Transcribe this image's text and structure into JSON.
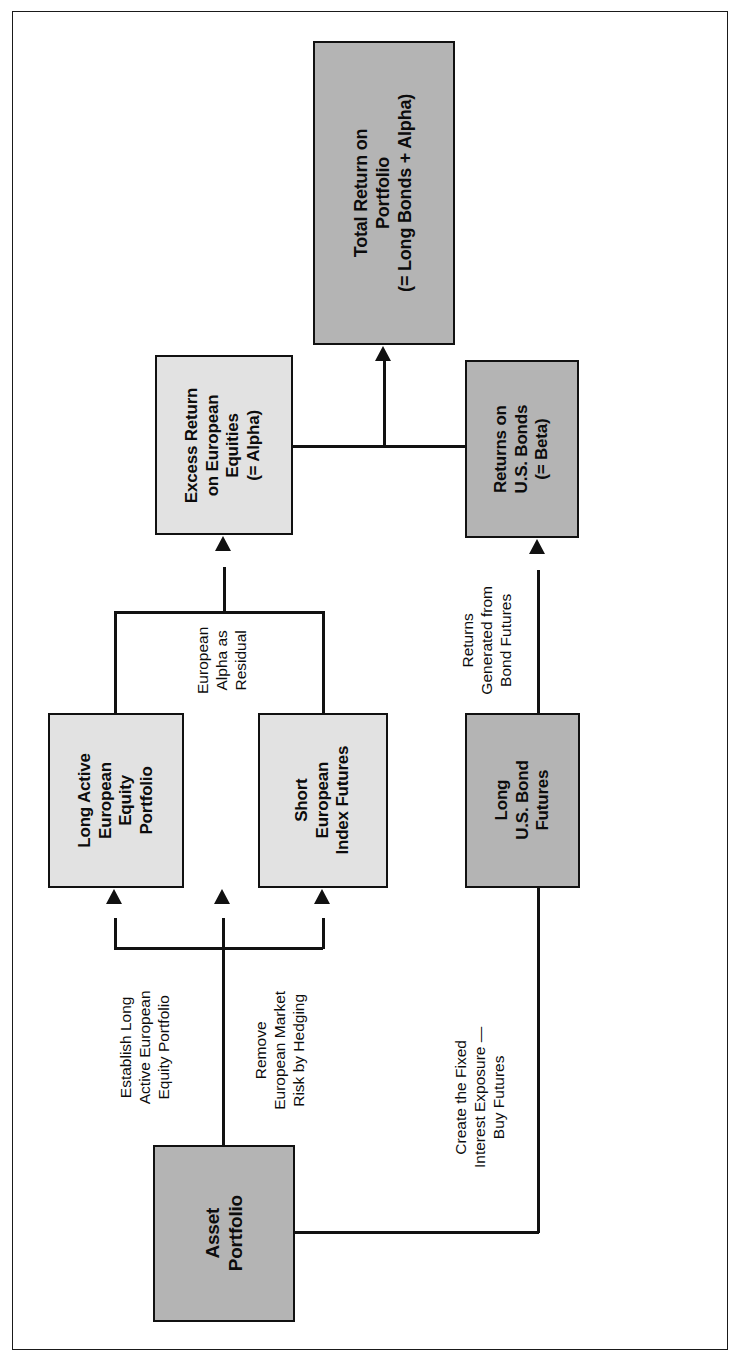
{
  "diagram": {
    "orientation": "rotated-90-counterclockwise",
    "colors": {
      "box_dark_fill": "#b4b4b4",
      "box_light_fill": "#e2e2e2",
      "stroke": "#111111",
      "page_background": "#ffffff",
      "frame_stroke": "#1a1a1a"
    },
    "nodes": [
      {
        "id": "total-return",
        "shade": "dark",
        "lines": [
          "Total Return on",
          "Portfolio",
          "(= Long Bonds + Alpha)"
        ]
      },
      {
        "id": "excess-return-alpha",
        "shade": "light",
        "lines": [
          "Excess Return",
          "on European",
          "Equities",
          "(= Alpha)"
        ]
      },
      {
        "id": "returns-us-bonds-beta",
        "shade": "dark",
        "lines": [
          "Returns on",
          "U.S. Bonds",
          "(= Beta)"
        ]
      },
      {
        "id": "long-active-european-equity-portfolio",
        "shade": "light",
        "lines": [
          "Long Active",
          "European",
          "Equity",
          "Portfolio"
        ]
      },
      {
        "id": "short-european-index-futures",
        "shade": "light",
        "lines": [
          "Short",
          "European",
          "Index Futures"
        ]
      },
      {
        "id": "long-us-bond-futures",
        "shade": "dark",
        "lines": [
          "Long",
          "U.S. Bond",
          "Futures"
        ]
      },
      {
        "id": "asset-portfolio",
        "shade": "dark",
        "lines": [
          "Asset",
          "Portfolio"
        ]
      }
    ],
    "edge_labels": [
      {
        "id": "european-alpha-as-residual",
        "lines": [
          "European",
          "Alpha as",
          "Residual"
        ]
      },
      {
        "id": "returns-generated-from-bond-futures",
        "lines": [
          "Returns",
          "Generated from",
          "Bond Futures"
        ]
      },
      {
        "id": "establish-long-active-european-equity-portfolio",
        "lines": [
          "Establish Long",
          "Active European",
          "Equity Portfolio"
        ]
      },
      {
        "id": "remove-european-market-risk-by-hedging",
        "lines": [
          "Remove",
          "European Market",
          "Risk by Hedging"
        ]
      },
      {
        "id": "create-the-fixed-interest-exposure-buy-futures",
        "lines": [
          "Create the Fixed",
          "Interest Exposure —",
          "Buy Futures"
        ]
      }
    ]
  }
}
